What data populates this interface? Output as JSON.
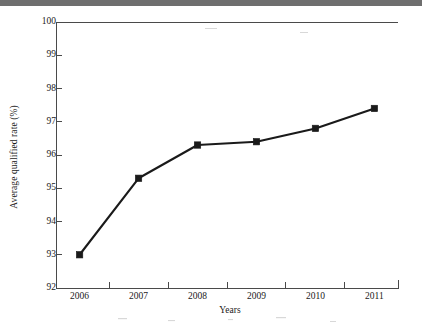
{
  "figure": {
    "background_color": "#ffffff",
    "ink_color": "#1a1a1a",
    "scan_bar_color": "#6e6e6e"
  },
  "chart_data": {
    "type": "line",
    "title": "",
    "xlabel": "Years",
    "ylabel": "Average qualified rate (%)",
    "categories": [
      "2006",
      "2007",
      "2008",
      "2009",
      "2010",
      "2011"
    ],
    "x": [
      2006,
      2007,
      2008,
      2009,
      2010,
      2011
    ],
    "values": [
      93.0,
      95.3,
      96.3,
      96.4,
      96.8,
      97.4
    ],
    "series": [
      {
        "name": "Average qualified rate",
        "values": [
          93.0,
          95.3,
          96.3,
          96.4,
          96.8,
          97.4
        ],
        "marker": "square",
        "marker_color": "#1a1a1a",
        "line_color": "#1a1a1a"
      }
    ],
    "xlim": [
      2005.6,
      2011.4
    ],
    "ylim": [
      92,
      100
    ],
    "ytick_labels": [
      "92",
      "93",
      "94",
      "95",
      "96",
      "97",
      "98",
      "99",
      "100"
    ],
    "ytick_values": [
      92,
      93,
      94,
      95,
      96,
      97,
      98,
      99,
      100
    ],
    "xtick_labels": [
      "2006",
      "2007",
      "2008",
      "2009",
      "2010",
      "2011"
    ],
    "grid": false,
    "legend": false,
    "legend_position": "none",
    "minor_xticks": true
  }
}
